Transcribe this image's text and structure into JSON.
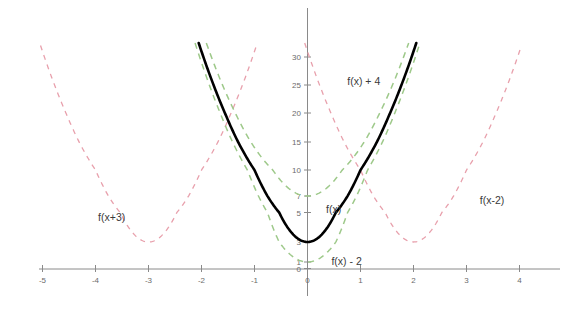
{
  "chart_data": {
    "type": "line",
    "title": "",
    "xlabel": "",
    "ylabel": "",
    "xlim": [
      -5.7,
      4.6
    ],
    "ylim": [
      -1.2,
      32.5
    ],
    "grid": false,
    "legend_position": "inline-annotations",
    "x_ticks": [
      -5,
      -4,
      -3,
      -2,
      -1,
      0,
      1,
      2,
      3,
      4
    ],
    "x_tick_labels": [
      "-5",
      "-4",
      "-3",
      "-2",
      "-1",
      "0",
      "1",
      "2",
      "3",
      "4"
    ],
    "y_ticks": [
      0,
      1,
      3,
      5,
      7,
      10,
      15,
      20,
      25,
      30
    ],
    "y_tick_labels": [
      "0",
      "1",
      "3",
      "5",
      "7",
      "10",
      "15",
      "20",
      "25",
      "30"
    ],
    "series": [
      {
        "name": "f(x)",
        "expression": "7x^2 + 3",
        "style": "solid",
        "color": "#000000",
        "vertex": [
          0,
          3
        ],
        "label": "f(x)",
        "label_xy": [
          0.35,
          5
        ]
      },
      {
        "name": "f(x) + 4",
        "expression": "7x^2 + 7",
        "style": "dashed",
        "color": "#9ec98a",
        "vertex": [
          0,
          7
        ],
        "label": "f(x) + 4",
        "label_xy": [
          0.75,
          25
        ]
      },
      {
        "name": "f(x) - 2",
        "expression": "7x^2 + 1",
        "style": "dashed",
        "color": "#9ec98a",
        "vertex": [
          0,
          1
        ],
        "label": "f(x) - 2",
        "label_xy": [
          0.45,
          0.6
        ]
      },
      {
        "name": "f(x+3)",
        "expression": "7(x+3)^2 + 3",
        "style": "dashed",
        "color": "#e8a0ac",
        "vertex": [
          -3,
          3
        ],
        "label": "f(x+3)",
        "label_xy": [
          -3.95,
          4.4
        ]
      },
      {
        "name": "f(x-2)",
        "expression": "7(x-2)^2 + 3",
        "style": "dashed",
        "color": "#e8a0ac",
        "vertex": [
          2,
          3
        ],
        "label": "f(x-2)",
        "label_xy": [
          3.25,
          6.0
        ]
      }
    ],
    "colors": {
      "main_curve": "#000000",
      "vertical_shift_curves": "#9ec98a",
      "horizontal_shift_curves": "#e8a0ac",
      "axis": "#8a8a8a",
      "tick_text": "#6b6b6b",
      "label_text": "#3a3a3a",
      "background": "#ffffff"
    }
  }
}
